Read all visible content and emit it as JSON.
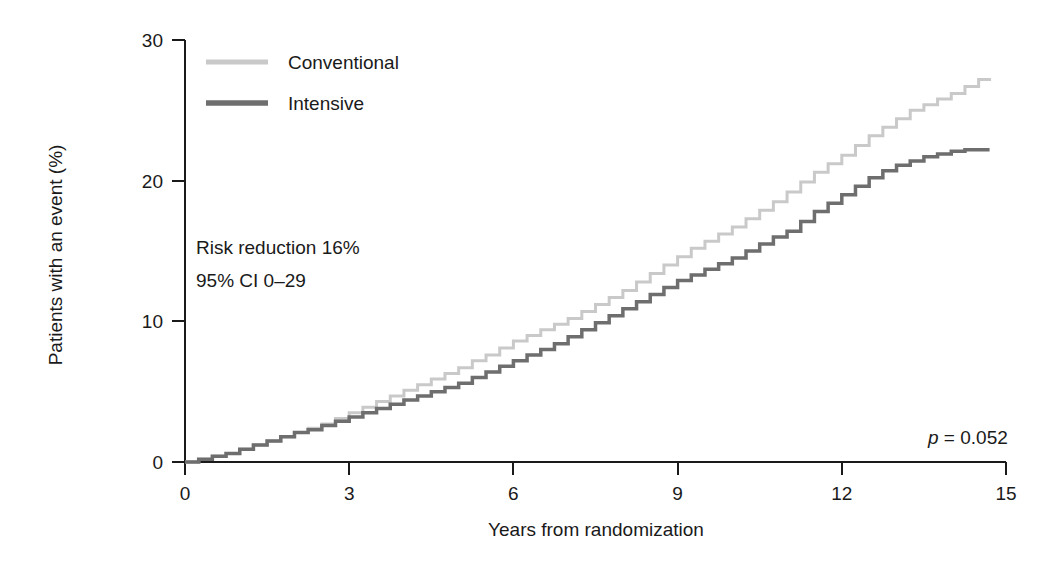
{
  "chart_data": {
    "type": "line",
    "title": "",
    "subtitle": "",
    "xlabel": "Years from randomization",
    "ylabel": "Patients with an event (%)",
    "xlim": [
      0,
      15
    ],
    "ylim": [
      0,
      30
    ],
    "xticks": [
      "0",
      "3",
      "6",
      "9",
      "12",
      "15"
    ],
    "xtick_values": [
      0,
      3,
      6,
      9,
      12,
      15
    ],
    "yticks": [
      "0",
      "10",
      "20",
      "30"
    ],
    "ytick_values": [
      0,
      10,
      20,
      30
    ],
    "grid": false,
    "legend_position": "top-left-inside",
    "step_style": "step-after",
    "series": [
      {
        "name": "Conventional",
        "color": "#c9c9c9",
        "linewidth": 3,
        "x": [
          0,
          0.25,
          0.5,
          0.75,
          1.0,
          1.25,
          1.5,
          1.75,
          2.0,
          2.25,
          2.5,
          2.75,
          3.0,
          3.25,
          3.5,
          3.75,
          4.0,
          4.25,
          4.5,
          4.75,
          5.0,
          5.25,
          5.5,
          5.75,
          6.0,
          6.25,
          6.5,
          6.75,
          7.0,
          7.25,
          7.5,
          7.75,
          8.0,
          8.25,
          8.5,
          8.75,
          9.0,
          9.25,
          9.5,
          9.75,
          10.0,
          10.25,
          10.5,
          10.75,
          11.0,
          11.25,
          11.5,
          11.75,
          12.0,
          12.25,
          12.5,
          12.75,
          13.0,
          13.25,
          13.5,
          13.75,
          14.0,
          14.25,
          14.5,
          14.7
        ],
        "y": [
          0.0,
          0.2,
          0.4,
          0.6,
          0.9,
          1.2,
          1.5,
          1.8,
          2.1,
          2.4,
          2.7,
          3.1,
          3.5,
          3.9,
          4.3,
          4.7,
          5.1,
          5.5,
          5.9,
          6.3,
          6.7,
          7.2,
          7.6,
          8.1,
          8.6,
          9.0,
          9.4,
          9.8,
          10.2,
          10.7,
          11.2,
          11.7,
          12.2,
          12.8,
          13.4,
          14.0,
          14.6,
          15.2,
          15.7,
          16.2,
          16.7,
          17.3,
          17.9,
          18.5,
          19.2,
          19.9,
          20.6,
          21.2,
          21.8,
          22.5,
          23.2,
          23.8,
          24.4,
          25.0,
          25.4,
          25.8,
          26.2,
          26.7,
          27.2,
          27.3
        ]
      },
      {
        "name": "Intensive",
        "color": "#6e6e6e",
        "linewidth": 3.5,
        "x": [
          0,
          0.25,
          0.5,
          0.75,
          1.0,
          1.25,
          1.5,
          1.75,
          2.0,
          2.25,
          2.5,
          2.75,
          3.0,
          3.25,
          3.5,
          3.75,
          4.0,
          4.25,
          4.5,
          4.75,
          5.0,
          5.25,
          5.5,
          5.75,
          6.0,
          6.25,
          6.5,
          6.75,
          7.0,
          7.25,
          7.5,
          7.75,
          8.0,
          8.25,
          8.5,
          8.75,
          9.0,
          9.25,
          9.5,
          9.75,
          10.0,
          10.25,
          10.5,
          10.75,
          11.0,
          11.25,
          11.5,
          11.75,
          12.0,
          12.25,
          12.5,
          12.75,
          13.0,
          13.25,
          13.5,
          13.75,
          14.0,
          14.25,
          14.5,
          14.7
        ],
        "y": [
          0.0,
          0.2,
          0.4,
          0.6,
          0.9,
          1.2,
          1.5,
          1.8,
          2.1,
          2.3,
          2.6,
          2.9,
          3.2,
          3.5,
          3.8,
          4.1,
          4.4,
          4.7,
          5.0,
          5.3,
          5.6,
          6.0,
          6.4,
          6.8,
          7.2,
          7.6,
          8.0,
          8.4,
          8.9,
          9.4,
          9.9,
          10.4,
          10.9,
          11.4,
          11.9,
          12.4,
          12.9,
          13.3,
          13.7,
          14.1,
          14.5,
          15.0,
          15.5,
          16.0,
          16.4,
          17.1,
          17.8,
          18.4,
          19.0,
          19.6,
          20.2,
          20.7,
          21.1,
          21.4,
          21.7,
          21.9,
          22.1,
          22.2,
          22.2,
          22.2
        ]
      }
    ],
    "annotations": [
      {
        "name": "risk-reduction",
        "text": "Risk reduction 16%",
        "x_px": 196,
        "y_px": 254
      },
      {
        "name": "confidence-interval",
        "text": "95% CI 0–29",
        "x_px": 196,
        "y_px": 287
      },
      {
        "name": "p-value",
        "text_italic": "p",
        "text_rest": " = 0.052",
        "x_px": 928,
        "y_px": 444
      }
    ]
  },
  "legend": {
    "entries": [
      {
        "label": "Conventional",
        "color": "#c9c9c9"
      },
      {
        "label": "Intensive",
        "color": "#6e6e6e"
      }
    ]
  },
  "axes": {
    "y_title": "Patients with an event (%)",
    "x_title": "Years from randomization"
  }
}
